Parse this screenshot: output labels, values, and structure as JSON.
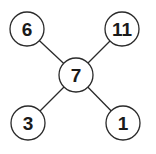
{
  "diagram": {
    "type": "star-graph",
    "center": {
      "label": "7",
      "x": 76,
      "y": 75
    },
    "nodes": [
      {
        "id": "top-left",
        "label": "6",
        "x": 27,
        "y": 29
      },
      {
        "id": "top-right",
        "label": "11",
        "x": 122,
        "y": 29
      },
      {
        "id": "bottom-left",
        "label": "3",
        "x": 28,
        "y": 123
      },
      {
        "id": "bottom-right",
        "label": "1",
        "x": 123,
        "y": 123
      }
    ],
    "edges": [
      {
        "from": "center",
        "to": "top-left"
      },
      {
        "from": "center",
        "to": "top-right"
      },
      {
        "from": "center",
        "to": "bottom-left"
      },
      {
        "from": "center",
        "to": "bottom-right"
      }
    ],
    "node_radius": 17,
    "colors": {
      "stroke": "#2a2a2a",
      "fill": "#ffffff",
      "text": "#1a1a1a"
    }
  }
}
